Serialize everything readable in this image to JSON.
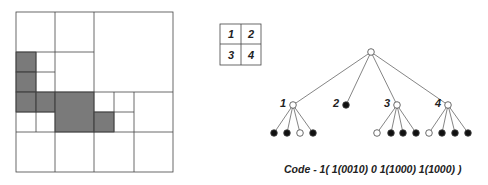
{
  "colors": {
    "line": "#444444",
    "shade": "#7a7a7a",
    "text": "#222222"
  },
  "quadrant_key": {
    "labels": [
      "1",
      "2",
      "3",
      "4"
    ]
  },
  "tree": {
    "root": {
      "filled": false
    },
    "children": [
      {
        "label": "1",
        "filled": false,
        "leaves": [
          true,
          true,
          false,
          true
        ]
      },
      {
        "label": "2",
        "filled": true,
        "leaves": []
      },
      {
        "label": "3",
        "filled": false,
        "leaves": [
          false,
          true,
          true,
          true
        ]
      },
      {
        "label": "4",
        "filled": false,
        "leaves": [
          false,
          true,
          true,
          true
        ]
      }
    ]
  },
  "code_text": "Code - 1( 1(0010) 0 1(1000) 1(1000) )"
}
